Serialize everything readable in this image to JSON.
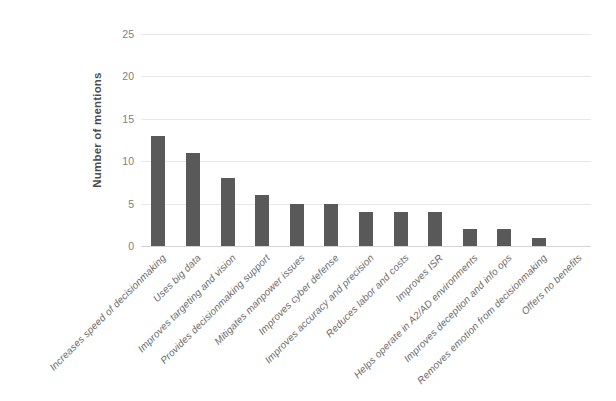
{
  "chart_data": {
    "type": "bar",
    "title": "",
    "subtitle": "",
    "xlabel": "",
    "ylabel": "Number of mentions",
    "ylim": [
      0,
      25
    ],
    "yticks": [
      0,
      5,
      10,
      15,
      20,
      25
    ],
    "grid": true,
    "legend": false,
    "legend_position": "none",
    "bar_color": "#595959",
    "gridline_color": "#e8e8e8",
    "axis_label_color": "#808080",
    "categories": [
      "Increases speed of decisionmaking",
      "Uses big data",
      "Improves targeting and vision",
      "Provides decisionmaking support",
      "Mitigates manpower issues",
      "Improves cyber defense",
      "Improves accuracy and precision",
      "Reduces labor and costs",
      "Improves ISR",
      "Helps operate in A2/AD environments",
      "Improves deception and info ops",
      "Removes emotion from decisionmaking",
      "Offers no benefits"
    ],
    "values": [
      13,
      11,
      8,
      6,
      5,
      5,
      4,
      4,
      4,
      2,
      2,
      1,
      0
    ]
  }
}
